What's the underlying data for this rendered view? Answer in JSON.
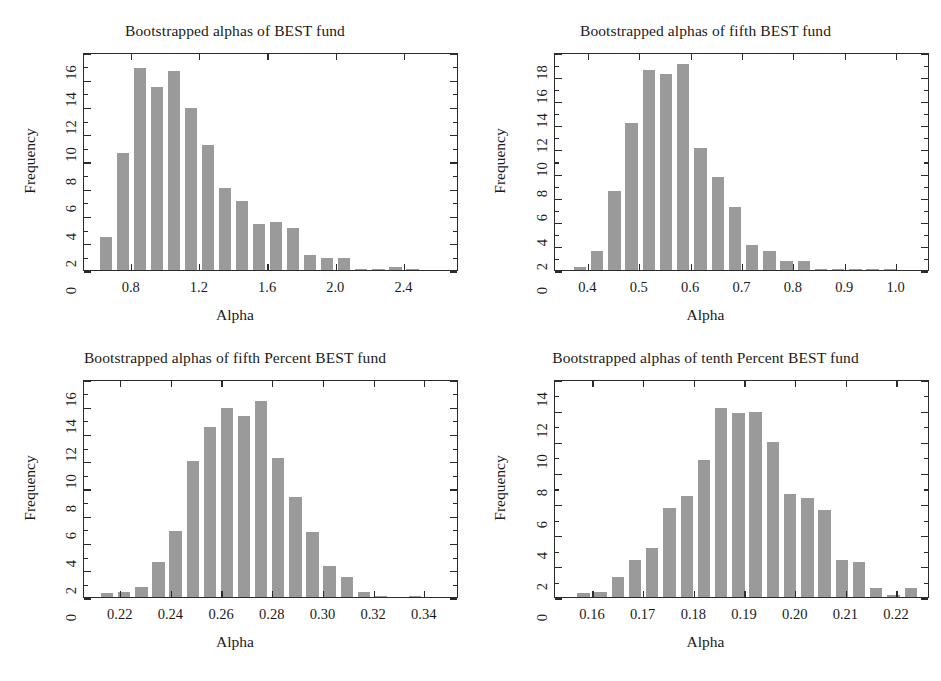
{
  "figure": {
    "background": "#ffffff",
    "bar_color": "#9a9a9a",
    "axis_color": "#2b2b2b",
    "panel_count": 4
  },
  "chart_data": [
    {
      "type": "bar",
      "title": "Bootstrapped alphas of BEST fund",
      "xlabel": "Alpha",
      "ylabel": "Frequency",
      "xlim": [
        0.52,
        2.72
      ],
      "ylim": [
        0,
        16
      ],
      "xticks": [
        0.8,
        1.2,
        1.6,
        2.0,
        2.4
      ],
      "xtick_labels": [
        "0.8",
        "1.2",
        "1.6",
        "2.0",
        "2.4"
      ],
      "yticks": [
        0,
        2,
        4,
        6,
        8,
        10,
        12,
        14,
        16
      ],
      "ytick_labels": [
        "0",
        "2",
        "4",
        "6",
        "8",
        "10",
        "12",
        "14",
        "16"
      ],
      "grid": false,
      "bin_width": 0.1,
      "bin_starts": [
        0.6,
        0.7,
        0.8,
        0.9,
        1.0,
        1.1,
        1.2,
        1.3,
        1.4,
        1.5,
        1.6,
        1.7,
        1.8,
        1.9,
        2.0,
        2.1,
        2.2,
        2.3,
        2.4,
        2.5
      ],
      "values": [
        2.4,
        8.6,
        14.8,
        13.4,
        14.6,
        11.9,
        9.2,
        6.0,
        5.1,
        3.35,
        3.5,
        3.1,
        1.1,
        0.85,
        0.85,
        0.05,
        0.1,
        0.2,
        0.05,
        0.0
      ]
    },
    {
      "type": "bar",
      "title": "Bootstrapped alphas of fifth BEST fund",
      "xlabel": "Alpha",
      "ylabel": "Frequency",
      "xlim": [
        0.335,
        1.065
      ],
      "ylim": [
        0,
        18
      ],
      "xticks": [
        0.4,
        0.5,
        0.6,
        0.7,
        0.8,
        0.9,
        1.0
      ],
      "xtick_labels": [
        "0.4",
        "0.5",
        "0.6",
        "0.7",
        "0.8",
        "0.9",
        "1.0"
      ],
      "yticks": [
        0,
        2,
        4,
        6,
        8,
        10,
        12,
        14,
        16,
        18
      ],
      "ytick_labels": [
        "0",
        "2",
        "4",
        "6",
        "8",
        "10",
        "12",
        "14",
        "16",
        "18"
      ],
      "grid": false,
      "bin_width": 0.0335,
      "bin_starts": [
        0.368,
        0.4015,
        0.435,
        0.4685,
        0.502,
        0.5355,
        0.569,
        0.6025,
        0.636,
        0.6695,
        0.703,
        0.7365,
        0.77,
        0.8035,
        0.837,
        0.8705,
        0.904,
        0.9375,
        0.971
      ],
      "values": [
        0.25,
        1.6,
        6.5,
        12.1,
        16.5,
        16.2,
        17.0,
        10.1,
        7.7,
        5.2,
        2.1,
        1.55,
        0.75,
        0.75,
        0.07,
        0.07,
        0.07,
        0.07,
        0.07
      ]
    },
    {
      "type": "bar",
      "title": "Bootstrapped alphas of fifth Percent BEST fund",
      "xlabel": "Alpha",
      "ylabel": "Frequency",
      "xlim": [
        0.2055,
        0.3535
      ],
      "ylim": [
        0,
        16
      ],
      "xticks": [
        0.22,
        0.24,
        0.26,
        0.28,
        0.3,
        0.32,
        0.34
      ],
      "xtick_labels": [
        "0.22",
        "0.24",
        "0.26",
        "0.28",
        "0.30",
        "0.32",
        "0.34"
      ],
      "yticks": [
        0,
        2,
        4,
        6,
        8,
        10,
        12,
        14,
        16
      ],
      "ytick_labels": [
        "0",
        "2",
        "4",
        "6",
        "8",
        "10",
        "12",
        "14",
        "16"
      ],
      "grid": false,
      "bin_width": 0.00675,
      "bin_starts": [
        0.2115,
        0.21825,
        0.225,
        0.23175,
        0.2385,
        0.24525,
        0.252,
        0.25875,
        0.2655,
        0.27225,
        0.279,
        0.28575,
        0.2925,
        0.29925,
        0.306,
        0.31275,
        0.3195,
        0.32625,
        0.333
      ],
      "values": [
        0.3,
        0.35,
        0.75,
        2.6,
        4.85,
        9.95,
        12.5,
        13.9,
        13.3,
        14.4,
        10.2,
        7.35,
        4.8,
        2.3,
        1.45,
        0.35,
        0.08,
        0.0,
        0.08
      ]
    },
    {
      "type": "bar",
      "title": "Bootstrapped alphas of tenth Percent BEST fund",
      "xlabel": "Alpha",
      "ylabel": "Frequency",
      "xlim": [
        0.1525,
        0.2265
      ],
      "ylim": [
        0,
        14
      ],
      "xticks": [
        0.16,
        0.17,
        0.18,
        0.19,
        0.2,
        0.21,
        0.22
      ],
      "xtick_labels": [
        "0.16",
        "0.17",
        "0.18",
        "0.19",
        "0.20",
        "0.21",
        "0.22"
      ],
      "yticks": [
        0,
        2,
        4,
        6,
        8,
        10,
        12,
        14
      ],
      "ytick_labels": [
        "0",
        "2",
        "4",
        "6",
        "8",
        "10",
        "12",
        "14"
      ],
      "grid": false,
      "bin_width": 0.0034,
      "bin_starts": [
        0.1565,
        0.1599,
        0.1633,
        0.1667,
        0.1701,
        0.1735,
        0.1769,
        0.1803,
        0.1837,
        0.1871,
        0.1905,
        0.1939,
        0.1973,
        0.2007,
        0.2041,
        0.2075,
        0.2109,
        0.2143,
        0.2177,
        0.2211
      ],
      "values": [
        0.25,
        0.3,
        1.3,
        2.35,
        3.15,
        5.7,
        6.5,
        8.8,
        12.15,
        11.8,
        11.85,
        9.95,
        6.6,
        6.35,
        5.6,
        2.35,
        2.25,
        0.55,
        0.1,
        0.6
      ]
    }
  ]
}
